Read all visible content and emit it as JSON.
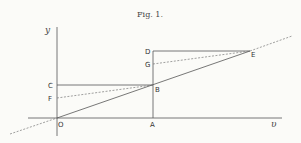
{
  "figure": {
    "title": "Fig. 1.",
    "axes": {
      "x_label": "υ",
      "y_label": "y"
    },
    "points": {
      "O": "O",
      "A": "A",
      "B": "B",
      "C": "C",
      "D": "D",
      "E": "E",
      "F": "F",
      "G": "G"
    },
    "colors": {
      "line": "#444444",
      "background": "#fbfbf8"
    }
  }
}
